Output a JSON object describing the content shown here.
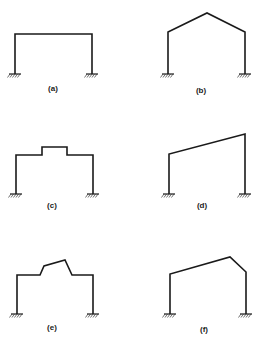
{
  "figure": {
    "panels": [
      {
        "id": "a",
        "label": "(a)",
        "description": "flat-roof portal frame, fixed bases",
        "path": [
          [
            15,
            74
          ],
          [
            15,
            34
          ],
          [
            92,
            34
          ],
          [
            92,
            74
          ]
        ],
        "supports": [
          [
            15,
            74
          ],
          [
            92,
            74
          ]
        ],
        "label_pos": [
          53,
          90
        ]
      },
      {
        "id": "b",
        "label": "(b)",
        "description": "gable (pitched) roof portal frame, fixed bases",
        "path": [
          [
            168,
            74
          ],
          [
            168,
            32
          ],
          [
            207,
            13
          ],
          [
            245,
            32
          ],
          [
            245,
            74
          ]
        ],
        "supports": [
          [
            168,
            74
          ],
          [
            245,
            74
          ]
        ],
        "label_pos": [
          201,
          92
        ]
      },
      {
        "id": "c",
        "label": "(c)",
        "description": "flat-roof portal frame with raised monitor section",
        "path": [
          [
            16,
            194
          ],
          [
            16,
            155
          ],
          [
            42,
            155
          ],
          [
            42,
            147
          ],
          [
            67,
            147
          ],
          [
            67,
            155
          ],
          [
            93,
            155
          ],
          [
            93,
            194
          ]
        ],
        "supports": [
          [
            16,
            194
          ],
          [
            93,
            194
          ]
        ],
        "label_pos": [
          52,
          207
        ]
      },
      {
        "id": "d",
        "label": "(d)",
        "description": "mono-pitch (sloped) roof portal frame, unequal columns",
        "path": [
          [
            169,
            194
          ],
          [
            169,
            154
          ],
          [
            245,
            134
          ],
          [
            245,
            194
          ]
        ],
        "supports": [
          [
            169,
            194
          ],
          [
            245,
            194
          ]
        ],
        "label_pos": [
          202,
          207
        ]
      },
      {
        "id": "e",
        "label": "(e)",
        "description": "portal frame with raised sawtooth monitor",
        "path": [
          [
            17,
            314
          ],
          [
            17,
            275
          ],
          [
            40,
            275
          ],
          [
            44,
            266
          ],
          [
            65,
            260
          ],
          [
            72,
            275
          ],
          [
            93,
            275
          ],
          [
            93,
            314
          ]
        ],
        "supports": [
          [
            17,
            314
          ],
          [
            93,
            314
          ]
        ],
        "label_pos": [
          52,
          329
        ]
      },
      {
        "id": "f",
        "label": "(f)",
        "description": "asymmetric pitched roof portal frame",
        "path": [
          [
            170,
            314
          ],
          [
            170,
            274
          ],
          [
            230,
            257
          ],
          [
            246,
            272
          ],
          [
            246,
            314
          ]
        ],
        "supports": [
          [
            170,
            314
          ],
          [
            246,
            314
          ]
        ],
        "label_pos": [
          204,
          331
        ]
      }
    ],
    "colors": {
      "line": "#1a1a1a",
      "background": "#ffffff"
    }
  }
}
